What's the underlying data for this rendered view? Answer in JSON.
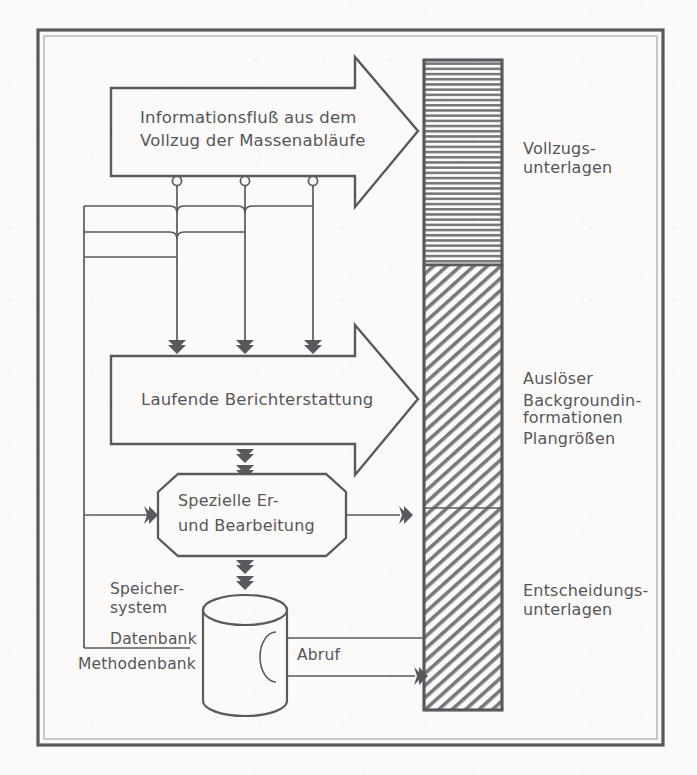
{
  "diagram": {
    "language": "de",
    "stroke_color": "#5a595e",
    "paper_color": "#fbfaf8",
    "frame": {
      "present": true,
      "style": "double-rule rectangle"
    },
    "arrows": [
      {
        "id": "arrow-top",
        "line1": "Informationsfluß aus dem",
        "line2": "Vollzug der Massenabläufe",
        "direction": "right",
        "target": "vollzugs-unterlagen"
      },
      {
        "id": "arrow-middle",
        "line1": "Laufende Berichterstattung",
        "line2": "",
        "direction": "right",
        "target": "ausloeser-background"
      }
    ],
    "nodes": [
      {
        "id": "node-spezielle",
        "shape": "octagon",
        "line1": "Spezielle Er-",
        "line2": "und Bearbeitung"
      },
      {
        "id": "node-cylinder",
        "shape": "cylinder",
        "label": "Datenspeicher"
      }
    ],
    "storage_labels": {
      "speicher_1": "Speicher-",
      "speicher_2": "system",
      "datenbank": "Datenbank",
      "methodenbank": "Methodenbank"
    },
    "connector_labels": {
      "abruf": "Abruf"
    },
    "bar": {
      "id": "output-bar",
      "segments": [
        {
          "id": "seg-vollzug",
          "hatch": "horizontal",
          "label_lines": [
            "Vollzugs-",
            "unterlagen"
          ]
        },
        {
          "id": "seg-ausloeser",
          "hatch": "diagonal",
          "label_lines": [
            "Auslöser",
            "Backgroundin-",
            "formationen",
            "Plangrößen"
          ]
        },
        {
          "id": "seg-entscheidung",
          "hatch": "diagonal",
          "label_lines": [
            "Entscheidungs-",
            "unterlagen"
          ]
        }
      ]
    },
    "bus": {
      "taps": 3,
      "rails": 3,
      "description": "Drei vertikale Abgriffe mit Kreisen, drei horizontale Sammelschienen"
    }
  }
}
